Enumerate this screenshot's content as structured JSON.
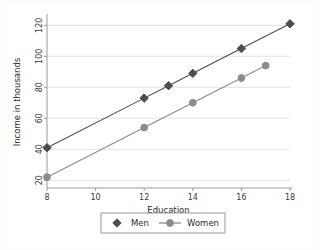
{
  "chart_data": {
    "type": "line",
    "title": "",
    "xlabel": "Education",
    "ylabel": "Income in thousands",
    "xlim": [
      8,
      18
    ],
    "ylim": [
      15,
      126
    ],
    "xticks": [
      8,
      10,
      12,
      14,
      16,
      18
    ],
    "yticks": [
      20,
      40,
      60,
      80,
      100,
      120
    ],
    "xtick_labels": [
      "8",
      "10",
      "12",
      "14",
      "16",
      "18"
    ],
    "ytick_labels": [
      "20",
      "40",
      "60",
      "80",
      "100",
      "120"
    ],
    "grid": "horizontal",
    "legend_position": "bottom-outside",
    "series": [
      {
        "name": "Men",
        "color": "#4d4d4d",
        "marker": "diamond",
        "x": [
          8,
          12,
          13,
          14,
          16,
          18
        ],
        "values": [
          41,
          73,
          81,
          89,
          105,
          121
        ]
      },
      {
        "name": "Women",
        "color": "#8c8c8c",
        "marker": "circle",
        "x": [
          8,
          12,
          14,
          16,
          17
        ],
        "values": [
          22,
          54,
          70,
          86,
          94
        ]
      }
    ]
  },
  "legend": {
    "items": [
      {
        "label": "Men",
        "marker": "diamond-marker",
        "color": "#4d4d4d"
      },
      {
        "label": "Women",
        "marker": "circle-marker",
        "color": "#8c8c8c"
      }
    ]
  },
  "colors": {
    "men_series": "#4d4d4d",
    "women_series": "#8c8c8c",
    "axis": "#9a9a9a",
    "grid": "#e3e3e3",
    "background": "#ffffff",
    "text": "#2a2a2a"
  }
}
